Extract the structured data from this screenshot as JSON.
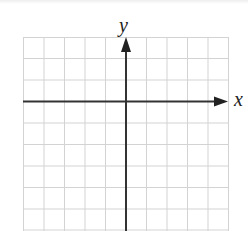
{
  "figure": {
    "type": "coordinate-plane",
    "x_axis_label": "x",
    "y_axis_label": "y",
    "grid": {
      "columns": 10,
      "rows": 9,
      "visible": true
    },
    "colors": {
      "grid": "#d0d0d0",
      "axis": "#333333",
      "background": "#ffffff"
    }
  }
}
